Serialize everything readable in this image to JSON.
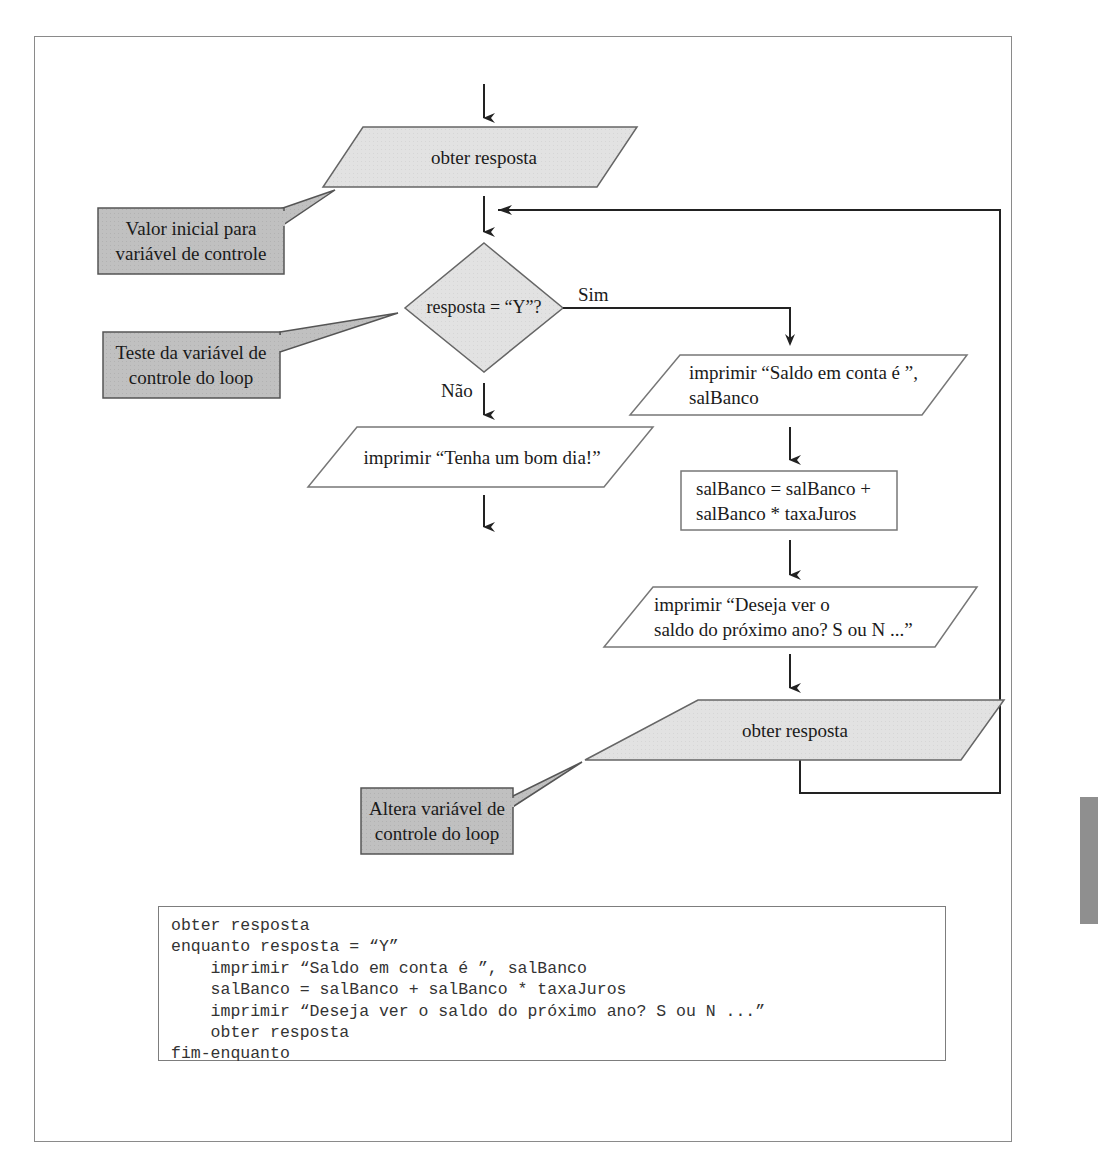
{
  "flowchart": {
    "start_input": {
      "label": "obter resposta",
      "shape": "parallelogram",
      "fill": "#e0e0e0"
    },
    "decision": {
      "label": "resposta = “Y”?",
      "shape": "diamond",
      "fill": "#e0e0e0"
    },
    "branch_yes_label": "Sim",
    "branch_no_label": "Não",
    "no_output": {
      "label": "imprimir “Tenha um bom dia!”",
      "shape": "parallelogram"
    },
    "yes_output_1": {
      "line1": "imprimir “Saldo em conta é ”,",
      "line2": "salBanco",
      "shape": "parallelogram"
    },
    "process": {
      "line1": "salBanco = salBanco +",
      "line2": "salBanco * taxaJuros",
      "shape": "rectangle"
    },
    "yes_output_2": {
      "line1": "imprimir “Deseja ver o",
      "line2": "saldo do próximo ano? S ou N ...”",
      "shape": "parallelogram"
    },
    "loop_input": {
      "label": "obter resposta",
      "shape": "parallelogram",
      "fill": "#e0e0e0"
    }
  },
  "callouts": [
    {
      "line1": "Valor inicial para",
      "line2": "variável de controle",
      "fill": "#bdbdbd"
    },
    {
      "line1": "Teste da variável de",
      "line2": "controle do loop",
      "fill": "#bdbdbd"
    },
    {
      "line1": "Altera variável de",
      "line2": "controle do loop",
      "fill": "#bdbdbd"
    }
  ],
  "pseudocode": {
    "lines": [
      "obter resposta",
      "enquanto resposta = “Y”",
      "    imprimir “Saldo em conta é ”, salBanco",
      "    salBanco = salBanco + salBanco * taxaJuros",
      "    imprimir “Deseja ver o saldo do próximo ano? S ou N ...”",
      "    obter resposta",
      "fim-enquanto"
    ]
  },
  "colors": {
    "shape_stroke": "#555555",
    "connector": "#222222",
    "shaded_fill": "#e0e0e0",
    "callout_fill": "#bdbdbd"
  }
}
